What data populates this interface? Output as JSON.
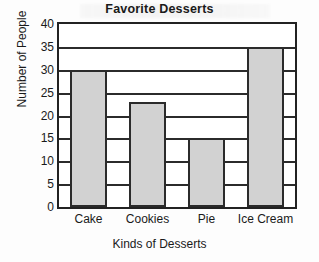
{
  "chart_data": {
    "type": "bar",
    "title": "Favorite Desserts",
    "xlabel": "Kinds of Desserts",
    "ylabel": "Number of People",
    "categories": [
      "Cake",
      "Cookies",
      "Pie",
      "Ice Cream"
    ],
    "values": [
      30,
      23,
      15,
      35
    ],
    "ylim": [
      0,
      40
    ],
    "ytick_step": 5,
    "yticks": [
      0,
      5,
      10,
      15,
      20,
      25,
      30,
      35,
      40
    ],
    "ytick_labels": [
      "0",
      "5",
      "10",
      "15",
      "20",
      "25",
      "30",
      "35",
      "40"
    ],
    "grid": true,
    "grid_axis": "y",
    "legend": false,
    "legend_position": "none",
    "bar_fill_color": "#d2d2d2",
    "bar_edge_color": "#2b2b2b",
    "axis_color": "#222222",
    "background_color": "#ffffff"
  }
}
